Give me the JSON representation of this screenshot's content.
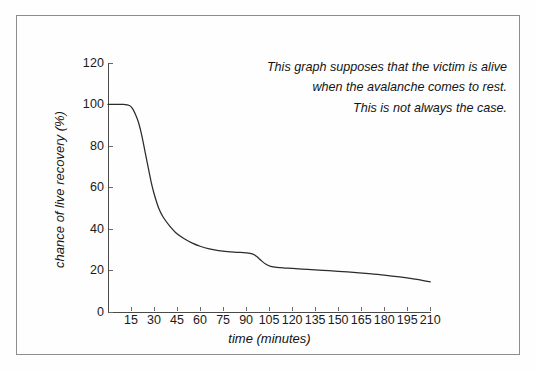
{
  "figure": {
    "annotation_lines": [
      "This graph supposes that the victim is alive",
      "when the avalanche comes to rest.",
      "This is not always the case."
    ]
  },
  "chart_data": {
    "type": "line",
    "title": "",
    "xlabel": "time (minutes)",
    "ylabel": "chance of live recovery (%)",
    "xlim": [
      0,
      215
    ],
    "ylim": [
      0,
      120
    ],
    "grid": false,
    "legend": null,
    "line_color": "#2b2b2b",
    "xticks": [
      15,
      30,
      45,
      60,
      75,
      90,
      105,
      120,
      135,
      150,
      165,
      180,
      195,
      210
    ],
    "yticks": [
      0,
      20,
      40,
      60,
      80,
      100,
      120
    ],
    "series": [
      {
        "name": "chance of live recovery",
        "x": [
          0,
          5,
          10,
          14,
          16,
          18,
          20,
          22,
          25,
          28,
          30,
          33,
          36,
          40,
          45,
          50,
          55,
          60,
          66,
          72,
          78,
          84,
          90,
          94,
          97,
          100,
          103,
          106,
          110,
          115,
          120,
          130,
          140,
          150,
          160,
          170,
          180,
          190,
          200,
          210
        ],
        "y": [
          100,
          100,
          100,
          99.5,
          98,
          95,
          91,
          85,
          74,
          63,
          57,
          50,
          45.5,
          41.5,
          37.5,
          35,
          33,
          31.5,
          30.2,
          29.4,
          28.9,
          28.6,
          28.3,
          27.8,
          26.5,
          24.5,
          22.8,
          21.8,
          21.3,
          21,
          20.8,
          20.3,
          19.9,
          19.4,
          18.9,
          18.3,
          17.6,
          16.7,
          15.6,
          14.3
        ]
      }
    ]
  }
}
